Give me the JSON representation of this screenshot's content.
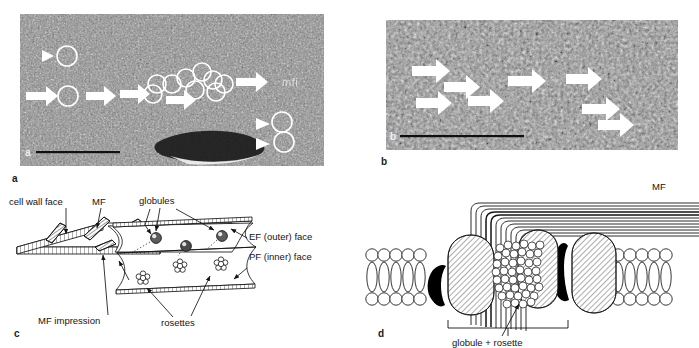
{
  "figure": {
    "panels": [
      {
        "letter": "a",
        "type": "micrograph",
        "inner_letter": "a",
        "description": "freeze-fracture electron micrograph EF face with circled globule particles, arrows tracing a linear file, and arrowheads",
        "annotations": {
          "circles_count": 13,
          "arrows_count": 6,
          "arrowheads_count": 3,
          "scale_bar": true,
          "corner_text": "mfi"
        }
      },
      {
        "letter": "b",
        "type": "micrograph",
        "inner_letter": "b",
        "description": "freeze-fracture electron micrograph PF face with white arrows indicating rosette rows",
        "annotations": {
          "arrows_count": 8,
          "scale_bar": true
        }
      },
      {
        "letter": "c",
        "type": "diagram",
        "description": "schematic of fractured plasma membrane showing cell wall face, microfibril impressions, EF and PF faces with globules and rosettes",
        "labels": [
          {
            "id": "cell-wall-face",
            "text": "cell wall face"
          },
          {
            "id": "mf",
            "text": "MF"
          },
          {
            "id": "globules",
            "text": "globules"
          },
          {
            "id": "ef-outer-face",
            "text": "EF (outer) face"
          },
          {
            "id": "pf-inner-face",
            "text": "PF (inner) face"
          },
          {
            "id": "mf-impression",
            "text": "MF impression"
          },
          {
            "id": "rosettes",
            "text": "rosettes"
          }
        ]
      },
      {
        "letter": "d",
        "type": "diagram",
        "description": "cross-section through the plasma membrane showing a terminal complex: globule plus rosette spanning the lipid bilayer with emerging microfibril",
        "labels": [
          {
            "id": "mf",
            "text": "MF"
          },
          {
            "id": "globule-rosette",
            "text": "globule + rosette"
          }
        ]
      }
    ]
  },
  "colors": {
    "ink": "#141414",
    "panel_letter": "#1a1a1a",
    "arrow_white": "#ffffff",
    "circle_white": "#ffffff",
    "membrane_fill": "#ffffff",
    "globule_hatch": "#6f6f6f",
    "dark_crescent": "#000000"
  }
}
